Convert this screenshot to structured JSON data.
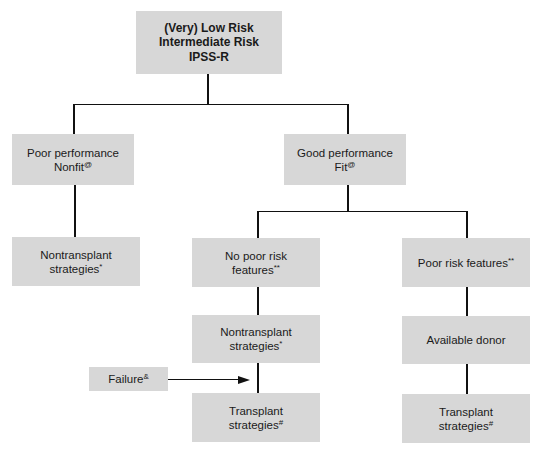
{
  "diagram": {
    "colors": {
      "box_fill": "#d7d7d7",
      "line": "#111111",
      "background": "#ffffff"
    },
    "nodes": {
      "root": {
        "lines": [
          "(Very) Low Risk",
          "Intermediate Risk",
          "IPSS-R"
        ]
      },
      "poor_performance": {
        "line1": "Poor performance",
        "line2": "Nonfit",
        "sup": "@"
      },
      "good_performance": {
        "line1": "Good performance",
        "line2": "Fit",
        "sup": "@"
      },
      "nontransplant_left": {
        "line1": "Nontransplant",
        "line2": "strategies",
        "sup": "*"
      },
      "no_poor_risk": {
        "line1": "No poor risk",
        "line2": "features",
        "sup": "**"
      },
      "poor_risk": {
        "line1": "Poor risk features",
        "sup": "**"
      },
      "nontransplant_mid": {
        "line1": "Nontransplant",
        "line2": "strategies",
        "sup": "*"
      },
      "available_donor": {
        "line1": "Available donor"
      },
      "failure": {
        "line1": "Failure",
        "sup": "&"
      },
      "transplant_mid": {
        "line1": "Transplant",
        "line2": "strategies",
        "sup": "#"
      },
      "transplant_right": {
        "line1": "Transplant",
        "line2": "strategies",
        "sup": "#"
      }
    },
    "edges": [
      {
        "from": "root",
        "to": "poor_performance"
      },
      {
        "from": "root",
        "to": "good_performance"
      },
      {
        "from": "poor_performance",
        "to": "nontransplant_left"
      },
      {
        "from": "good_performance",
        "to": "no_poor_risk"
      },
      {
        "from": "good_performance",
        "to": "poor_risk"
      },
      {
        "from": "no_poor_risk",
        "to": "nontransplant_mid"
      },
      {
        "from": "nontransplant_mid",
        "to": "transplant_mid"
      },
      {
        "from": "poor_risk",
        "to": "available_donor"
      },
      {
        "from": "available_donor",
        "to": "transplant_right"
      },
      {
        "from": "failure",
        "to": "transplant_mid",
        "type": "arrow"
      }
    ]
  }
}
